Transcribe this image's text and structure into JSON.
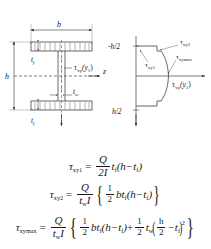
{
  "figure": {
    "cross_section": {
      "width_label": "b",
      "height_label": "h",
      "flange_thickness_label": "t",
      "flange_thickness_sub": "f",
      "web_thickness_label": "t",
      "web_thickness_sub": "w",
      "stress_callout": "τ",
      "stress_callout_sub": "xy",
      "stress_callout_arg": "(y",
      "stress_callout_arg_sub": "1",
      "stress_callout_close": ")",
      "z_axis_label": "z",
      "y_axis_label": "y"
    },
    "stress_plot": {
      "top_axis_label": "-h/2",
      "bottom_axis_label": "h/2",
      "y_axis_label": "y",
      "x_axis_label": "τ",
      "x_axis_label_sub": "xy",
      "x_axis_label_arg": "(y",
      "x_axis_label_arg_sub": "1",
      "x_axis_label_close": ")",
      "callout_tau1": "τ",
      "callout_tau1_sub": "xy1",
      "callout_tau2": "τ",
      "callout_tau2_sub": "xy2",
      "callout_taumax": "τ",
      "callout_taumax_sub": "xymax"
    }
  },
  "equations": {
    "eq1": {
      "lhs": "τ",
      "lhs_sub": "xy1",
      "equals": "=",
      "frac_num": "Q",
      "frac_den": "2I",
      "tail_t": "t",
      "tail_t_sub": "f",
      "tail_open": "(h",
      "tail_minus": "−",
      "tail_t2": "t",
      "tail_t2_sub": "f",
      "tail_close": ")"
    },
    "eq2": {
      "lhs": "τ",
      "lhs_sub": "xy2",
      "equals": "=",
      "frac_num": "Q",
      "frac_den_t": "t",
      "frac_den_t_sub": "w",
      "frac_den_I": "I",
      "brace_open": "{",
      "sfrac_num": "1",
      "sfrac_den": "2",
      "term_b": "bt",
      "term_b_sub": "f",
      "term_open": "(h",
      "term_minus": "−",
      "term_t": "t",
      "term_t_sub": "f",
      "term_close": ")",
      "brace_close": "}"
    },
    "eq3": {
      "lhs": "τ",
      "lhs_sub": "xymax",
      "equals": "=",
      "frac_num": "Q",
      "frac_den_t": "t",
      "frac_den_t_sub": "w",
      "frac_den_I": "I",
      "brace_open": "{",
      "sfrac1_num": "1",
      "sfrac1_den": "2",
      "term1_b": "bt",
      "term1_b_sub": "f",
      "term1_open": "(h",
      "term1_minus": "−",
      "term1_t": "t",
      "term1_t_sub": "f",
      "term1_close": ")",
      "plus": "+",
      "sfrac2_num": "1",
      "sfrac2_den": "2",
      "term2_t": "t",
      "term2_t_sub": "w",
      "paren_open": "(",
      "inner_num": "h",
      "inner_den": "2",
      "inner_minus": "−",
      "term2_tf": "t",
      "term2_tf_sub": "f",
      "paren_close": ")",
      "exponent": "2",
      "brace_close": "}"
    }
  },
  "colors": {
    "ink": "#1a1a1a",
    "line": "#555555",
    "thin": "#888888",
    "background": "#ffffff"
  }
}
